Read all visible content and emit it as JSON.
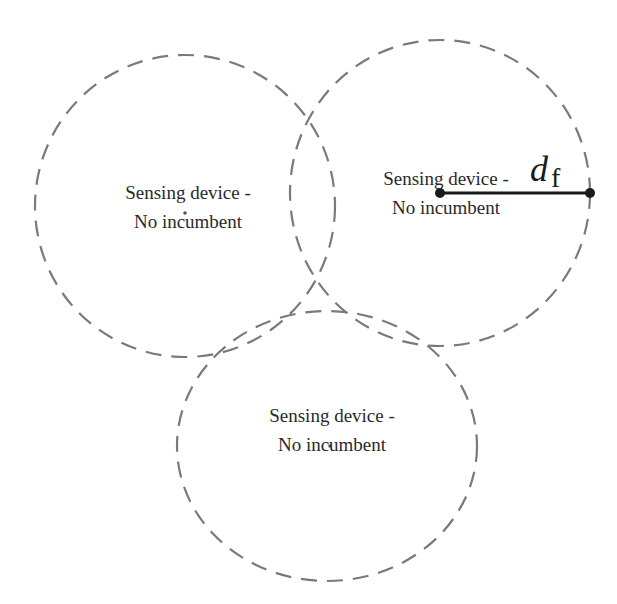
{
  "diagram": {
    "type": "coverage-circles",
    "colors": {
      "circle_stroke": "#7a7a7a",
      "text": "#2a2a2a",
      "radius_line": "#1a1a1a",
      "background": "#ffffff"
    },
    "nodes": [
      {
        "id": "left",
        "line1": "Sensing device -",
        "line2": "No incumbent",
        "cx": 185,
        "cy": 206,
        "rx": 150,
        "ry": 151
      },
      {
        "id": "right",
        "line1": "Sensing device -",
        "line2": "No incumbent",
        "cx": 440,
        "cy": 193,
        "rx": 150,
        "ry": 153
      },
      {
        "id": "bottom",
        "line1": "Sensing device -",
        "line2": "No incumbent",
        "cx": 327,
        "cy": 446,
        "rx": 150,
        "ry": 135
      }
    ],
    "radius_annotation": {
      "symbol": "d",
      "subscript": "f",
      "from": [
        440,
        193
      ],
      "to": [
        590,
        193
      ]
    }
  }
}
